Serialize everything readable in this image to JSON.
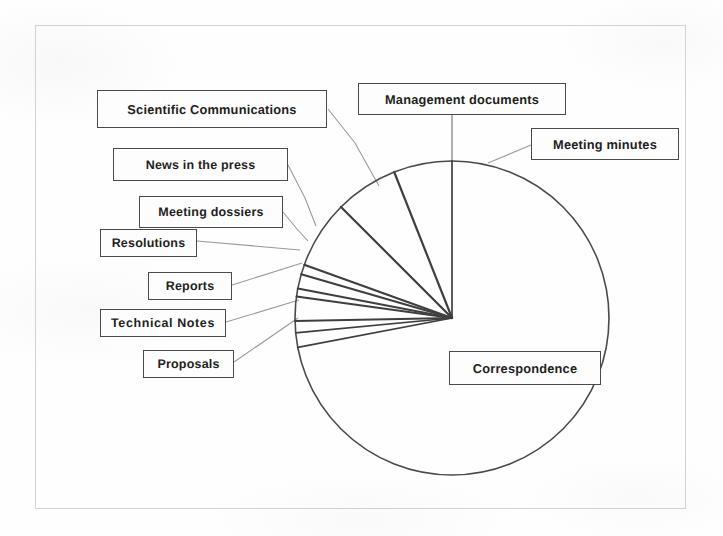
{
  "figure": {
    "kind": "scanned-pie-chart",
    "frame_color": "#d2d2d2",
    "ink_color": "#3f3f3f",
    "leader_color": "#9a9a9a",
    "box_border_color": "#4a4a4a",
    "background": "#fefefe"
  },
  "chart_data": {
    "type": "pie",
    "title": "",
    "subtitle": "",
    "xlabel": "",
    "ylabel": "",
    "legend_position": "callout-labels",
    "grid": false,
    "units": "share of documents",
    "start_angle_deg": -90,
    "direction": "counterclockwise",
    "categories": [
      "Correspondence",
      "Meeting minutes",
      "Management documents",
      "Scientific Communications",
      "News in the press",
      "Meeting dossiers",
      "Resolutions",
      "Reports",
      "Technical Notes",
      "Proposals"
    ],
    "values": [
      72.0,
      6.0,
      6.5,
      7.0,
      1.0,
      1.5,
      0.8,
      2.5,
      1.2,
      1.5
    ],
    "slices": [
      {
        "label": "Correspondence",
        "value": 72.0,
        "start_deg": -90.0,
        "end_deg": 169.2
      },
      {
        "label": "Proposals",
        "value": 1.5,
        "start_deg": 169.2,
        "end_deg": 174.6
      },
      {
        "label": "Technical Notes",
        "value": 1.2,
        "start_deg": 174.6,
        "end_deg": 178.9
      },
      {
        "label": "Reports",
        "value": 2.5,
        "start_deg": 178.9,
        "end_deg": 187.9
      },
      {
        "label": "Resolutions",
        "value": 0.8,
        "start_deg": 187.9,
        "end_deg": 190.8
      },
      {
        "label": "Meeting dossiers",
        "value": 1.5,
        "start_deg": 190.8,
        "end_deg": 196.2
      },
      {
        "label": "News in the press",
        "value": 1.0,
        "start_deg": 196.2,
        "end_deg": 199.8
      },
      {
        "label": "Scientific Communications",
        "value": 7.0,
        "start_deg": 199.8,
        "end_deg": 225.0
      },
      {
        "label": "Management documents",
        "value": 6.5,
        "start_deg": 225.0,
        "end_deg": 248.4
      },
      {
        "label": "Meeting minutes",
        "value": 6.0,
        "start_deg": 248.4,
        "end_deg": 270.0
      }
    ],
    "geometry": {
      "cx": 452,
      "cy": 318,
      "r": 157
    }
  },
  "labels": {
    "scientific_communications": "Scientific Communications",
    "news_in_the_press": "News in the press",
    "meeting_dossiers": "Meeting dossiers",
    "resolutions": "Resolutions",
    "reports": "Reports",
    "technical_notes": "Technical  Notes",
    "proposals": "Proposals",
    "management_documents": "Management documents",
    "meeting_minutes": "Meeting minutes",
    "correspondence": "Correspondence"
  }
}
